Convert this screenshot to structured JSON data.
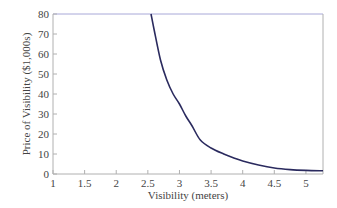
{
  "chart_data": {
    "type": "line",
    "title": "",
    "xlabel": "Visibility (meters)",
    "ylabel": "Price of Visibility ($1,000s)",
    "xlim": [
      1,
      5.27
    ],
    "ylim": [
      0,
      80
    ],
    "xticks": [
      1,
      1.5,
      2,
      2.5,
      3,
      3.5,
      4,
      4.5,
      5
    ],
    "xtick_labels": [
      "1",
      "1.5",
      "2",
      "2.5",
      "3",
      "3.5",
      "4",
      "4.5",
      "5"
    ],
    "yticks": [
      0,
      10,
      20,
      30,
      40,
      50,
      60,
      70,
      80
    ],
    "ytick_labels": [
      "0",
      "10",
      "20",
      "30",
      "40",
      "50",
      "60",
      "70",
      "80"
    ],
    "grid": false,
    "legend": null,
    "series": [
      {
        "name": "Price of Visibility",
        "color": "#2a2a5e",
        "x": [
          2.55,
          2.6,
          2.7,
          2.8,
          2.9,
          3.0,
          3.1,
          3.2,
          3.33,
          3.5,
          3.7,
          3.86,
          4.0,
          4.25,
          4.5,
          4.75,
          5.0,
          5.27
        ],
        "y": [
          80,
          72,
          57,
          47,
          40,
          35,
          29,
          24,
          17,
          13,
          10,
          8,
          6.5,
          4.5,
          3,
          2.2,
          1.8,
          1.6
        ]
      }
    ]
  },
  "colors": {
    "curve": "#2a2a5e",
    "frame_top": "#a8a8d8",
    "frame": "#b0b0b0",
    "text": "#444444"
  }
}
